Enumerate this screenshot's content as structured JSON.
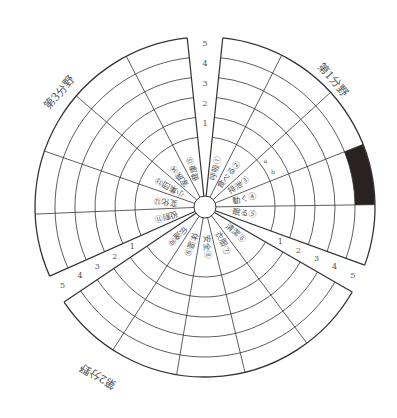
{
  "diagram": {
    "center": [
      205,
      207
    ],
    "inner_radius": 11,
    "label_ring_radius": 70,
    "ring_step": 20,
    "levels": [
      "1",
      "2",
      "3",
      "4",
      "5"
    ],
    "line_color": "#333333",
    "fill_color": "#2a2222",
    "sections": [
      {
        "title": "第1分野",
        "start_deg": -84,
        "end_deg": 20,
        "items": [
          {
            "num": "①",
            "label": "呼吸"
          },
          {
            "num": "②",
            "label": "食べる"
          },
          {
            "num": "③",
            "label": "排泄",
            "sub": [
              "a",
              "b"
            ]
          },
          {
            "num": "④",
            "label": "動く"
          },
          {
            "num": "⑤",
            "label": "眠る"
          }
        ],
        "title_pos": [
          330,
          82
        ],
        "title_rot": 50
      },
      {
        "title": "第2分野",
        "start_deg": 30,
        "end_deg": 146,
        "items": [
          {
            "num": "⑥",
            "label": "清潔"
          },
          {
            "num": "⑦",
            "label": "衣服"
          },
          {
            "num": "⑧",
            "label": "安全"
          },
          {
            "num": "⑨",
            "label": "体温"
          },
          {
            "num": "⑩",
            "label": "伝達"
          }
        ],
        "title_pos": [
          100,
          373
        ],
        "title_rot": 210
      },
      {
        "title": "第3分野",
        "start_deg": 156,
        "end_deg": 264,
        "items": [
          {
            "num": "⑪",
            "label": "役割"
          },
          {
            "num": "⑫",
            "label": "変化"
          },
          {
            "num": "⑬",
            "label": "小集団"
          },
          {
            "num": "⑭",
            "label": "家族"
          },
          {
            "num": "⑮",
            "label": "健康"
          }
        ],
        "title_pos": [
          62,
          95
        ],
        "title_rot": -50
      }
    ],
    "filled_cell": {
      "section": 0,
      "item": 3,
      "from_level": 5,
      "to_level": 5,
      "note": "dark shaded block at outer ring of first section"
    }
  }
}
